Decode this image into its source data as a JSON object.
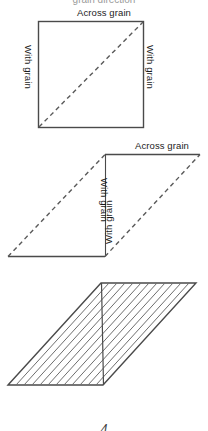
{
  "figure": {
    "clipped_heading": "grain direction",
    "page_number": "4",
    "background_color": "#ffffff",
    "stroke_color": "#4a4a4a",
    "dash_color": "#5a5a5a",
    "hatch_color": "#6e6e6e",
    "panels": [
      {
        "id": "square-panel",
        "shape": "square",
        "top_label": "Across grain",
        "left_label": "With grain",
        "right_label": "With grain",
        "diagonal": "dashed"
      },
      {
        "id": "parallelogram-panel",
        "shape": "parallelogram",
        "top_label": "Across grain",
        "left_label": "With grain",
        "right_label": "With grain",
        "diagonal": "dashed"
      },
      {
        "id": "hatched-panel",
        "shape": "parallelogram",
        "hatching": "diagonal",
        "hatch_count": 11
      }
    ]
  }
}
